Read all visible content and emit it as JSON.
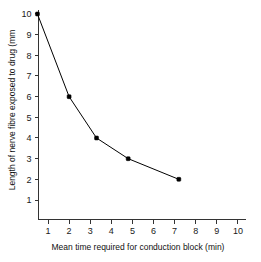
{
  "chart_data": {
    "type": "line",
    "title": "",
    "xlabel": "Mean time required for conduction block (min)",
    "ylabel": "Length of nerve fibre exposed to drug (mm",
    "xlim": [
      0,
      10
    ],
    "ylim": [
      0,
      10
    ],
    "xticks": [
      1,
      2,
      3,
      4,
      5,
      6,
      7,
      8,
      9,
      10
    ],
    "yticks": [
      1,
      2,
      3,
      4,
      5,
      6,
      7,
      8,
      9,
      10
    ],
    "xtick_labels": [
      "1",
      "2",
      "3",
      "4",
      "5",
      "6",
      "7",
      "8",
      "9",
      "10"
    ],
    "ytick_labels": [
      "1",
      "2",
      "3",
      "4",
      "5",
      "6",
      "7",
      "8",
      "9",
      "10"
    ],
    "grid": false,
    "legend": false,
    "marker": "square",
    "marker_color": "#000000",
    "line_color": "#000000",
    "background_color": "#ffffff",
    "series": [
      {
        "name": "nerve fibre length vs conduction block time",
        "points": [
          {
            "x": 0.5,
            "y": 10
          },
          {
            "x": 2.0,
            "y": 6
          },
          {
            "x": 3.3,
            "y": 4
          },
          {
            "x": 4.8,
            "y": 3
          },
          {
            "x": 7.2,
            "y": 2
          }
        ]
      }
    ]
  }
}
